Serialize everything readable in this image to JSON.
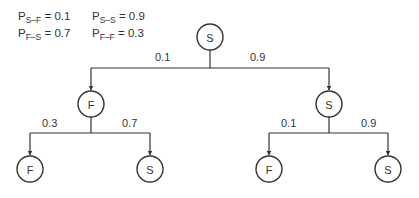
{
  "legend": {
    "rows": [
      [
        {
          "symbol": "P",
          "subscript": "S–F",
          "value": "= 0.1"
        },
        {
          "symbol": "P",
          "subscript": "S–S",
          "value": "= 0.9"
        }
      ],
      [
        {
          "symbol": "P",
          "subscript": "F–S",
          "value": "= 0.7"
        },
        {
          "symbol": "P",
          "subscript": "F–F",
          "value": "= 0.3"
        }
      ]
    ]
  },
  "tree": {
    "root": {
      "label": "S"
    },
    "level1": {
      "left": {
        "label": "F",
        "edge_prob": "0.1"
      },
      "right": {
        "label": "S",
        "edge_prob": "0.9"
      }
    },
    "level2": {
      "left_left": {
        "label": "F",
        "edge_prob": "0.3"
      },
      "left_right": {
        "label": "S",
        "edge_prob": "0.7"
      },
      "right_left": {
        "label": "F",
        "edge_prob": "0.1"
      },
      "right_right": {
        "label": "S",
        "edge_prob": "0.9"
      }
    }
  },
  "colors": {
    "line": "#333333",
    "background": "#ffffff"
  }
}
